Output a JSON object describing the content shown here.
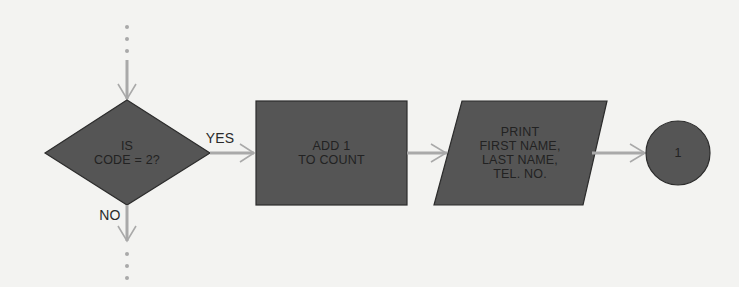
{
  "diagram": {
    "type": "flowchart",
    "colors": {
      "shape_fill": "#555555",
      "shape_stroke": "#2c2c2c",
      "connector": "#a9a9a9",
      "background": "#f3f3f1",
      "text": "#222222"
    },
    "nodes": [
      {
        "id": "decision",
        "shape": "diamond",
        "text": "IS\nCODE = 2?"
      },
      {
        "id": "process",
        "shape": "rectangle",
        "text": "ADD 1\nTO COUNT"
      },
      {
        "id": "output",
        "shape": "parallelogram",
        "text": "PRINT\nFIRST NAME,\nLAST NAME,\nTEL. NO."
      },
      {
        "id": "connector",
        "shape": "circle",
        "text": "1"
      }
    ],
    "edges": [
      {
        "from": "(continued above)",
        "to": "decision",
        "label": "",
        "style": "dotted-then-solid"
      },
      {
        "from": "decision",
        "to": "process",
        "label": "YES"
      },
      {
        "from": "process",
        "to": "output",
        "label": ""
      },
      {
        "from": "output",
        "to": "connector",
        "label": ""
      },
      {
        "from": "decision",
        "to": "(continues below)",
        "label": "NO",
        "style": "solid-then-dotted"
      }
    ],
    "labels": {
      "yes": "YES",
      "no": "NO"
    }
  }
}
